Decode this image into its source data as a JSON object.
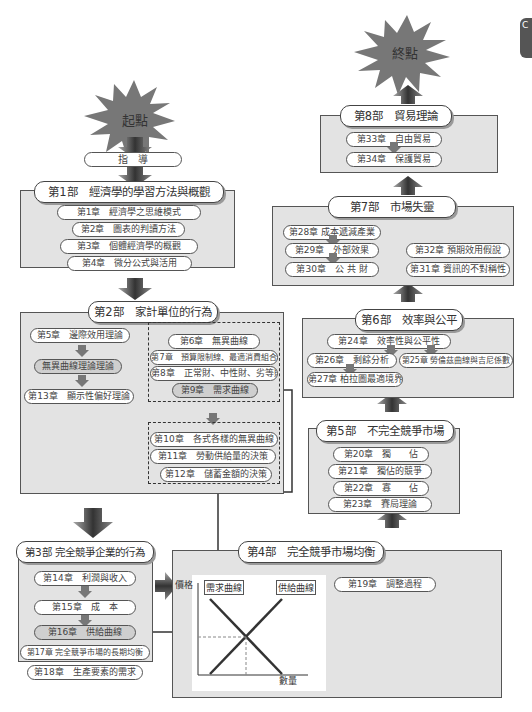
{
  "start": {
    "label": "起點"
  },
  "end": {
    "label": "終點"
  },
  "side_tab": {
    "label": "C"
  },
  "guide": {
    "label": "指　導"
  },
  "part1": {
    "title": "第1部　經濟學的學習方法與概觀",
    "chapters": [
      "第1章　經濟學之思維模式",
      "第2章　圖表的判讀方法",
      "第3章　個體經濟學的概觀",
      "第4章　微分公式與活用"
    ]
  },
  "part2": {
    "title": "第2部　家計單位的行為",
    "left": [
      "第5章　邊際效用理論",
      "無異曲線理論理論",
      "第13章　顯示性偏好理論"
    ],
    "group1": [
      "第6章　無異曲線",
      "第7章　預算限制線、最適消費組合",
      "第8章　正常財、中性財、劣等財",
      "第9章　需求曲線"
    ],
    "group2": [
      "第10章　各式各樣的無異曲線",
      "第11章　勞動供給量的決策",
      "第12章　儲蓄金額的決策"
    ]
  },
  "part3": {
    "title": "第3部 完全競爭企業的行為",
    "chapters": [
      "第14章　利潤與收入",
      "第15章　成　本",
      "第16章　供給曲線",
      "第17章 完全競爭市場的長期均衡",
      "第18章　生產要素的需求"
    ]
  },
  "part4": {
    "title": "第4部　完全競爭市場均衡",
    "chapters": [
      "第19章　調整過程"
    ],
    "graph": {
      "y_label": "價格",
      "x_label": "數量",
      "demand_label": "需求曲線",
      "supply_label": "供給曲線"
    }
  },
  "part5": {
    "title": "第5部　不完全競爭市場",
    "chapters": [
      "第20章　獨　　佔",
      "第21章　獨佔的競爭",
      "第22章　寡　　佔",
      "第23章　賽局理論"
    ]
  },
  "part6": {
    "title": "第6部　效率與公平",
    "chapters": [
      "第24章　效率性與公平性",
      "第26章　剩餘分析",
      "第25章 勞倫茲曲線與吉尼係數",
      "第27章 柏拉圖最適境界"
    ]
  },
  "part7": {
    "title": "第7部　市場失靈",
    "chapters": [
      "第28章 成本遞減產業",
      "第29章　外部效果",
      "第30章　公 共 財",
      "第32章 預期效用假說",
      "第31章 資訊的不對稱性"
    ]
  },
  "part8": {
    "title": "第8部　貿易理論",
    "chapters": [
      "第33章　自由貿易",
      "第34章　保護貿易"
    ]
  },
  "colors": {
    "box_fill": "#e3e3e3",
    "border": "#555555",
    "highlight": "#cfcfcf"
  }
}
